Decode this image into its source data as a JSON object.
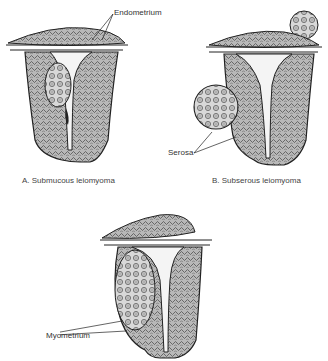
{
  "figure": {
    "panels": [
      {
        "id": "A",
        "caption": "A. Submucous leiomyoma",
        "labels": [
          "Endometrium"
        ]
      },
      {
        "id": "B",
        "caption": "B. Subserous leiomyoma",
        "labels": [
          "Serosa"
        ]
      },
      {
        "id": "C",
        "caption": "",
        "labels": [
          "Myometrium"
        ]
      }
    ]
  },
  "colors": {
    "line": "#222222",
    "fill_tissue": "#9a9a9a",
    "fill_light": "#f4f4f4",
    "background": "#ffffff"
  }
}
